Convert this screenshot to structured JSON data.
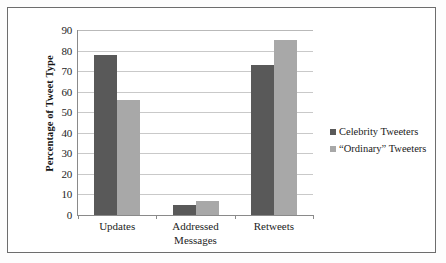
{
  "chart_data": {
    "type": "bar",
    "title": "",
    "xlabel": "",
    "ylabel": "Percentage of Tweet Type",
    "ylim": [
      0,
      90
    ],
    "ytick_step": 10,
    "yticks": [
      90,
      80,
      70,
      60,
      50,
      40,
      30,
      20,
      10,
      0
    ],
    "grid": true,
    "legend_position": "right",
    "categories": [
      "Updates",
      "Addressed Messages",
      "Retweets"
    ],
    "category_lines": [
      [
        "Updates"
      ],
      [
        "Addressed",
        "Messages"
      ],
      [
        "Retweets"
      ]
    ],
    "series": [
      {
        "name": "Celebrity Tweeters",
        "color": "#595959",
        "values": [
          78,
          5,
          73
        ]
      },
      {
        "name": "“Ordinary” Tweeters",
        "color": "#a8a8a8",
        "values": [
          56,
          7,
          85
        ]
      }
    ]
  },
  "legend": {
    "items": [
      {
        "label": "Celebrity Tweeters"
      },
      {
        "label": "“Ordinary” Tweeters"
      }
    ]
  },
  "colors": {
    "series_a": "#595959",
    "series_b": "#a8a8a8",
    "gridline": "#c9c9c9",
    "axis": "#8a8a8a",
    "frame": "#6d6d6d",
    "background": "#ffffff"
  }
}
